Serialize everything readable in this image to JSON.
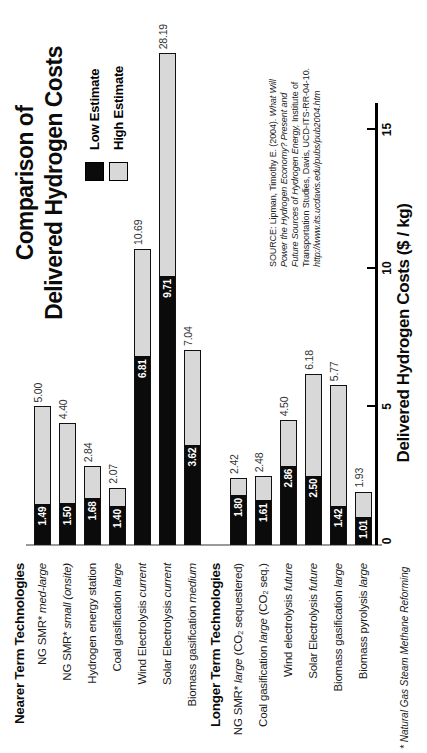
{
  "chart_data": {
    "type": "bar",
    "orientation": "horizontal stacked-range bars, whole chart rendered rotated 90 degrees counter-clockwise",
    "title_lines": [
      "Comparison of",
      "Delivered Hydrogen Costs"
    ],
    "xlabel": "Delivered Hydrogen Costs ($ / kg)",
    "x_ticks": [
      0,
      5,
      10,
      15
    ],
    "x_axis_drawn_to": 15.95,
    "bar_clip_value": 17.75,
    "grid": "off",
    "legend": {
      "position": "upper-right of plot",
      "items": [
        {
          "label": "Low Estimate",
          "color": "#0b0b0b"
        },
        {
          "label": "High Estimate",
          "color": "#d8d8d8"
        }
      ]
    },
    "rows": [
      {
        "type": "header",
        "segments": [
          {
            "t": "Nearer Term Technologies",
            "i": false
          }
        ]
      },
      {
        "type": "bar",
        "segments": [
          {
            "t": "NG SMR* ",
            "i": false
          },
          {
            "t": "med-large",
            "i": true
          }
        ],
        "low": 1.49,
        "high": 5.0,
        "low_label": "1.49",
        "high_label": "5.00"
      },
      {
        "type": "bar",
        "segments": [
          {
            "t": "NG SMR* ",
            "i": false
          },
          {
            "t": "small (onsite)",
            "i": true
          }
        ],
        "low": 1.5,
        "high": 4.4,
        "low_label": "1.50",
        "high_label": "4.40"
      },
      {
        "type": "bar",
        "segments": [
          {
            "t": "Hydrogen energy station",
            "i": false
          }
        ],
        "low": 1.68,
        "high": 2.84,
        "low_label": "1.68",
        "high_label": "2.84"
      },
      {
        "type": "bar",
        "segments": [
          {
            "t": "Coal gasification ",
            "i": false
          },
          {
            "t": "large",
            "i": true
          }
        ],
        "low": 1.4,
        "high": 2.07,
        "low_label": "1.40",
        "high_label": "2.07"
      },
      {
        "type": "bar",
        "segments": [
          {
            "t": "Wind Electrolysis ",
            "i": false
          },
          {
            "t": "current",
            "i": true
          }
        ],
        "low": 6.81,
        "high": 10.69,
        "low_label": "6.81",
        "high_label": "10.69"
      },
      {
        "type": "bar",
        "segments": [
          {
            "t": "Solar Electrolysis ",
            "i": false
          },
          {
            "t": "current",
            "i": true
          }
        ],
        "low": 9.71,
        "high": 28.19,
        "low_label": "9.71",
        "high_label": "28.19"
      },
      {
        "type": "bar",
        "segments": [
          {
            "t": "Biomass gasification ",
            "i": false
          },
          {
            "t": "medium",
            "i": true
          }
        ],
        "low": 3.62,
        "high": 7.04,
        "low_label": "3.62",
        "high_label": "7.04"
      },
      {
        "type": "header",
        "segments": [
          {
            "t": "Longer Term Technologies",
            "i": false
          }
        ]
      },
      {
        "type": "bar",
        "segments": [
          {
            "t": "NG SMR* ",
            "i": false
          },
          {
            "t": "large",
            "i": true
          },
          {
            "t": " (CO₂ sequestered)",
            "i": false
          }
        ],
        "low": 1.8,
        "high": 2.42,
        "low_label": "1.80",
        "high_label": "2.42"
      },
      {
        "type": "bar",
        "segments": [
          {
            "t": "Coal gasification ",
            "i": false
          },
          {
            "t": "large",
            "i": true
          },
          {
            "t": " (CO₂ seq.)",
            "i": false
          }
        ],
        "low": 1.61,
        "high": 2.48,
        "low_label": "1.61",
        "high_label": "2.48"
      },
      {
        "type": "bar",
        "segments": [
          {
            "t": "Wind electrolysis ",
            "i": false
          },
          {
            "t": "future",
            "i": true
          }
        ],
        "low": 2.86,
        "high": 4.5,
        "low_label": "2.86",
        "high_label": "4.50"
      },
      {
        "type": "bar",
        "segments": [
          {
            "t": "Solar Electrolysis ",
            "i": false
          },
          {
            "t": "future",
            "i": true
          }
        ],
        "low": 2.5,
        "high": 6.18,
        "low_label": "2.50",
        "high_label": "6.18"
      },
      {
        "type": "bar",
        "segments": [
          {
            "t": "Biomass gasification ",
            "i": false
          },
          {
            "t": "large",
            "i": true
          }
        ],
        "low": 1.42,
        "high": 5.77,
        "low_label": "1.42",
        "high_label": "5.77"
      },
      {
        "type": "bar",
        "segments": [
          {
            "t": "Biomass pyrolysis ",
            "i": false
          },
          {
            "t": "large",
            "i": true
          }
        ],
        "low": 1.01,
        "high": 1.93,
        "low_label": "1.01",
        "high_label": "1.93"
      }
    ],
    "footnote": "* Natural Gas Steam Methane Reforming",
    "source_lines": [
      [
        {
          "t": "SOURCE: Lipman, Timothy E. (2004). ",
          "i": false
        },
        {
          "t": "What Will",
          "i": true
        }
      ],
      [
        {
          "t": "Power the Hydrogen Economy? Present and",
          "i": true
        }
      ],
      [
        {
          "t": "Future Sources of Hydrogen Energy,",
          "i": true
        },
        {
          "t": " Institute of",
          "i": false
        }
      ],
      [
        {
          "t": "Transportation Studies, Davis, UCD-ITS-RR-04-10.",
          "i": false
        }
      ],
      [
        {
          "t": "http://www.its.ucdavis.edu/pubs/pub2004.htm",
          "i": true
        }
      ]
    ],
    "colors": {
      "low_estimate": "#0b0b0b",
      "high_estimate_fill": "#d8d8d8",
      "bar_border": "#111111",
      "axis_line": "#000000",
      "baseline": "#9a9a9a",
      "background": "#ffffff"
    }
  }
}
